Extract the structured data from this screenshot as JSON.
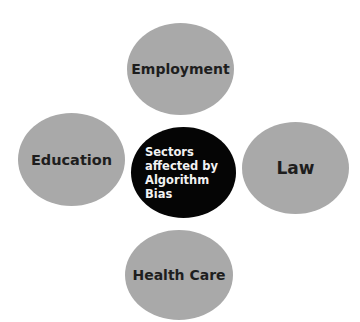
{
  "diagram": {
    "type": "hub-and-spoke",
    "center": {
      "label": "Sectors\naffected   by\nAlgorithm\nBias"
    },
    "nodes": [
      {
        "id": "employment",
        "label": "Employment",
        "position": "top"
      },
      {
        "id": "education",
        "label": "Education",
        "position": "left"
      },
      {
        "id": "law",
        "label": "Law",
        "position": "right"
      },
      {
        "id": "health-care",
        "label": "Health Care",
        "position": "bottom"
      }
    ],
    "colors": {
      "outer_fill": "#a9a9a9",
      "center_fill": "#050505",
      "outer_text": "#1e1e1e",
      "center_text": "#f2f2f2"
    }
  }
}
